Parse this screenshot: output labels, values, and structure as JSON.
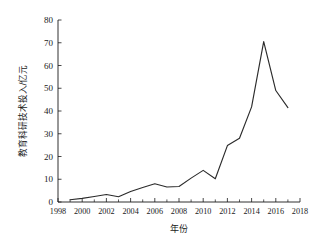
{
  "chart_data": {
    "type": "line",
    "title": "",
    "xlabel": "年份",
    "ylabel": "教育科研技术投入/亿元",
    "xlim": [
      1998,
      2018
    ],
    "ylim": [
      0,
      80
    ],
    "xticks": [
      1998,
      2000,
      2002,
      2004,
      2006,
      2008,
      2010,
      2012,
      2014,
      2016,
      2018
    ],
    "xtick_labels": [
      "1998",
      "2000",
      "2002",
      "2004",
      "2006",
      "2008",
      "2010",
      "2012",
      "2014",
      "2016",
      "2018"
    ],
    "xtick_minor_step": 1,
    "yticks": [
      0,
      10,
      20,
      30,
      40,
      50,
      60,
      70,
      80
    ],
    "ytick_labels": [
      "0",
      "10",
      "20",
      "30",
      "40",
      "50",
      "60",
      "70",
      "80"
    ],
    "grid": false,
    "legend": false,
    "legend_position": "none",
    "line_color": "#2b2b2b",
    "background_color": "#ffffff",
    "x": [
      1999,
      2000,
      2001,
      2002,
      2003,
      2004,
      2005,
      2006,
      2007,
      2008,
      2009,
      2010,
      2011,
      2012,
      2013,
      2014,
      2015,
      2016,
      2017
    ],
    "values": [
      1.0,
      1.6,
      2.4,
      3.3,
      2.3,
      4.6,
      6.4,
      8.0,
      6.6,
      6.8,
      10.5,
      13.9,
      10.2,
      24.8,
      28.0,
      41.8,
      70.5,
      49.0,
      41.5
    ],
    "series": [
      {
        "name": "教育科研技术投入",
        "values": [
          1.0,
          1.6,
          2.4,
          3.3,
          2.3,
          4.6,
          6.4,
          8.0,
          6.6,
          6.8,
          10.5,
          13.9,
          10.2,
          24.8,
          28.0,
          41.8,
          70.5,
          49.0,
          41.5
        ]
      }
    ],
    "annotations": []
  }
}
